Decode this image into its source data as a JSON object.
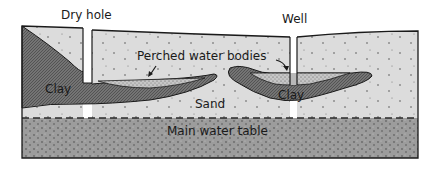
{
  "diagram": {
    "type": "geologic cross-section",
    "labels": {
      "dry_hole": "Dry hole",
      "well": "Well",
      "perched_water_bodies": "Perched water bodies",
      "clay_left": "Clay",
      "clay_right": "Clay",
      "sand": "Sand",
      "main_water_table": "Main water table"
    },
    "colors": {
      "sand": "#dcdcdc",
      "clay": "#6e6e6e",
      "saturated_zone": "#9a9a9a",
      "perched_water": "#c4c4c4",
      "outline": "#1a1a1a",
      "background": "#ffffff"
    }
  }
}
